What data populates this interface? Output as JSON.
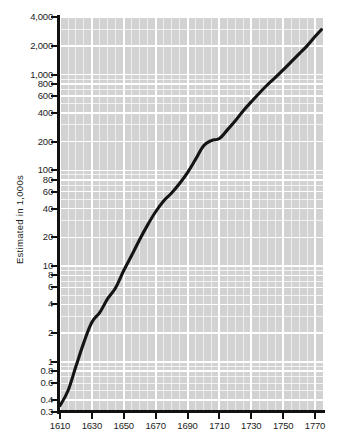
{
  "chart_data": {
    "type": "line",
    "title": "",
    "subtitle": "",
    "xlabel": "",
    "ylabel": "Estimated in 1,000s",
    "yscale": "log",
    "xscale": "linear",
    "ylim": [
      0.3,
      4000
    ],
    "xlim": [
      1610,
      1775
    ],
    "grid": true,
    "legend": null,
    "ytick_labels": [
      "4,000",
      "2,000",
      "1,000",
      "800",
      "600",
      "400",
      "200",
      "100",
      "80",
      "60",
      "40",
      "20",
      "10",
      "8",
      "6",
      "4",
      "2",
      "1",
      "0.8",
      "0.6",
      "0.4",
      "0.3"
    ],
    "ytick_values": [
      4000,
      2000,
      1000,
      800,
      600,
      400,
      200,
      100,
      80,
      60,
      40,
      20,
      10,
      8,
      6,
      4,
      2,
      1,
      0.8,
      0.6,
      0.4,
      0.3
    ],
    "xtick_labels": [
      "1610",
      "1630",
      "1650",
      "1670",
      "1690",
      "1710",
      "1730",
      "1750",
      "1770"
    ],
    "xtick_values": [
      1610,
      1630,
      1650,
      1670,
      1690,
      1710,
      1730,
      1750,
      1770
    ],
    "series": [
      {
        "name": "Estimated population",
        "color": "#141414",
        "x": [
          1610,
          1615,
          1620,
          1625,
          1630,
          1635,
          1640,
          1645,
          1650,
          1655,
          1660,
          1665,
          1670,
          1675,
          1680,
          1685,
          1690,
          1695,
          1700,
          1705,
          1710,
          1715,
          1720,
          1725,
          1730,
          1735,
          1740,
          1745,
          1750,
          1755,
          1760,
          1765,
          1770,
          1774
        ],
        "y": [
          0.35,
          0.5,
          0.9,
          1.6,
          2.6,
          3.3,
          4.6,
          6.0,
          9.0,
          13.0,
          19.0,
          27.0,
          37.0,
          48.0,
          58.0,
          73.0,
          95.0,
          130.0,
          180.0,
          205.0,
          215.0,
          265.0,
          330.0,
          420.0,
          520.0,
          640.0,
          780.0,
          930.0,
          1120.0,
          1360.0,
          1650.0,
          2000.0,
          2500.0,
          2950.0
        ]
      }
    ],
    "annotations": []
  },
  "axis": {
    "y_title": "Estimated in 1,000s"
  }
}
